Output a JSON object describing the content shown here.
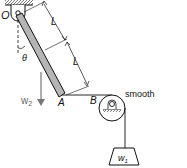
{
  "labels": {
    "pivot": "O",
    "angle": "θ",
    "length1": "L",
    "length2": "L",
    "weight_bar": "w",
    "weight_bar_sub": "2",
    "point_a": "A",
    "point_b": "B",
    "surface": "smooth",
    "weight_hanging": "w",
    "weight_hanging_sub": "1"
  },
  "colors": {
    "bar": "#b5b5b5",
    "line": "#111111",
    "arrow": "#777777"
  }
}
